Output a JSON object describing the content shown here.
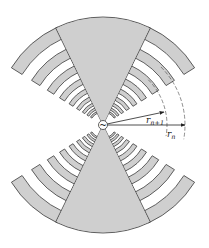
{
  "diagram": {
    "center": {
      "x": 103,
      "y": 125
    },
    "colors": {
      "fill": "#cfcfcf",
      "stroke": "#3a3a3a",
      "background": "#ffffff",
      "annotation": "#222222"
    },
    "wedge": {
      "half_angle_deg": 26,
      "outer_radius": 108
    },
    "teeth": {
      "tooth_half_angle_deg": 58,
      "tau": 0.78,
      "count": 9,
      "outer_radius_first": 108,
      "tooth_fraction": 0.5
    },
    "feed": {
      "radius": 4.5,
      "symbol": "~"
    },
    "annotations": {
      "r_n": {
        "label": "r",
        "sub": "n",
        "tip": {
          "x": 185,
          "y": 125
        },
        "label_pos": {
          "x": 167,
          "y": 137
        }
      },
      "r_n1": {
        "label": "r",
        "sub": "n+1",
        "tip": {
          "x": 164,
          "y": 112
        },
        "label_pos": {
          "x": 146,
          "y": 123
        }
      },
      "dashed_arcs": [
        {
          "radius": 82
        },
        {
          "radius": 64
        }
      ]
    }
  }
}
